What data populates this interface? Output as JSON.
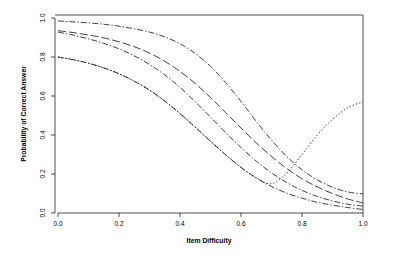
{
  "chart_data": {
    "type": "line",
    "title": "",
    "xlabel": "Item Difficulty",
    "ylabel": "Probability of Correct Answer",
    "xlim": [
      0.0,
      1.0
    ],
    "ylim": [
      0.0,
      1.0
    ],
    "xticks": [
      "0.0",
      "0.2",
      "0.4",
      "0.6",
      "0.8",
      "1.0"
    ],
    "xtick_values": [
      0.0,
      0.2,
      0.4,
      0.6,
      0.8,
      1.0
    ],
    "yticks": [
      "0.0",
      "0.2",
      "0.4",
      "0.6",
      "0.8",
      "1.0"
    ],
    "ytick_values": [
      0.0,
      0.2,
      0.4,
      0.6,
      0.8,
      1.0
    ],
    "grid": false,
    "legend": "none",
    "box": "L-shaped axes with tick marks outward",
    "x": [
      0.0,
      0.05,
      0.1,
      0.15,
      0.2,
      0.25,
      0.3,
      0.35,
      0.4,
      0.45,
      0.5,
      0.55,
      0.6,
      0.65,
      0.7,
      0.75,
      0.8,
      0.85,
      0.9,
      0.95,
      1.0
    ],
    "series": [
      {
        "name": "curve-1-upper",
        "linetype": "dot-dash",
        "values": [
          0.985,
          0.98,
          0.975,
          0.968,
          0.958,
          0.945,
          0.928,
          0.903,
          0.868,
          0.818,
          0.752,
          0.668,
          0.572,
          0.47,
          0.374,
          0.29,
          0.222,
          0.17,
          0.132,
          0.108,
          0.098
        ]
      },
      {
        "name": "curve-2",
        "linetype": "long-dash",
        "values": [
          0.935,
          0.925,
          0.913,
          0.898,
          0.878,
          0.853,
          0.82,
          0.778,
          0.726,
          0.664,
          0.592,
          0.515,
          0.436,
          0.36,
          0.29,
          0.228,
          0.176,
          0.134,
          0.1,
          0.072,
          0.052
        ]
      },
      {
        "name": "curve-3",
        "linetype": "dot-dash",
        "values": [
          0.928,
          0.912,
          0.893,
          0.87,
          0.842,
          0.806,
          0.762,
          0.708,
          0.644,
          0.57,
          0.492,
          0.412,
          0.336,
          0.266,
          0.206,
          0.156,
          0.116,
          0.085,
          0.062,
          0.045,
          0.035
        ]
      },
      {
        "name": "curve-4-lower",
        "linetype": "dot-dash",
        "values": [
          0.8,
          0.786,
          0.768,
          0.744,
          0.714,
          0.676,
          0.63,
          0.574,
          0.51,
          0.44,
          0.368,
          0.298,
          0.234,
          0.18,
          0.136,
          0.102,
          0.076,
          0.055,
          0.04,
          0.028,
          0.018
        ]
      },
      {
        "name": "curve-5-rising-dotted",
        "linetype": "dotted",
        "values": [
          0.8,
          0.786,
          0.768,
          0.744,
          0.714,
          0.676,
          0.63,
          0.574,
          0.51,
          0.44,
          0.368,
          0.298,
          0.234,
          0.18,
          0.15,
          0.205,
          0.3,
          0.4,
          0.48,
          0.54,
          0.57
        ]
      }
    ],
    "colors": {
      "axis": "#000000",
      "curve": "#000000",
      "background": "#ffffff"
    }
  }
}
